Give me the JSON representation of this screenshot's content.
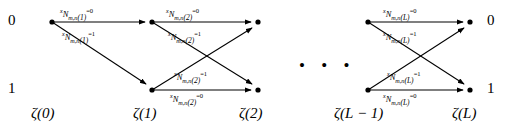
{
  "figure": {
    "type": "trellis-diagram",
    "states": [
      {
        "id": "state-0",
        "label": "0",
        "row": "top"
      },
      {
        "id": "state-1",
        "label": "1",
        "row": "bottom"
      }
    ],
    "stage_labels": [
      "ζ(0)",
      "ζ(1)",
      "ζ(2)",
      "ζ(L − 1)",
      "ζ(L)"
    ],
    "ellipsis": "• • •",
    "edge_label_parts": {
      "prefix": "x",
      "symbol": "N",
      "subscript": "m,n",
      "eq0": "=0",
      "eq1": "=1"
    },
    "edge_labels": [
      {
        "id": "e-s1-top0",
        "stage": "1",
        "value": "0",
        "text": "x N m,n (1) =0"
      },
      {
        "id": "e-s1-top1",
        "stage": "1",
        "value": "1",
        "text": "x N m,n (1) =1"
      },
      {
        "id": "e-s2-top0",
        "stage": "2",
        "value": "0",
        "text": "x N m,n (2) =0"
      },
      {
        "id": "e-s2-top1",
        "stage": "2",
        "value": "1",
        "text": "x N m,n (2) =1"
      },
      {
        "id": "e-s2-bot1",
        "stage": "2",
        "value": "1",
        "text": "x N m,n (2) =1"
      },
      {
        "id": "e-s2-bot0",
        "stage": "2",
        "value": "0",
        "text": "x N m,n (2) =0"
      },
      {
        "id": "e-sL-top0",
        "stage": "L",
        "value": "0",
        "text": "x N m,n (L) =0"
      },
      {
        "id": "e-sL-top1",
        "stage": "L",
        "value": "1",
        "text": "x N m,n (L) =1"
      },
      {
        "id": "e-sL-bot1",
        "stage": "L",
        "value": "1",
        "text": "x N m,n (L) =1"
      },
      {
        "id": "e-sL-bot0",
        "stage": "L",
        "value": "0",
        "text": "x N m,n (L) =0"
      }
    ],
    "stage_args": {
      "s1": "(1)",
      "s2": "(2)",
      "sL": "(L)"
    },
    "colors": {
      "line": "#000000",
      "text": "#000000",
      "background": "#ffffff"
    }
  }
}
